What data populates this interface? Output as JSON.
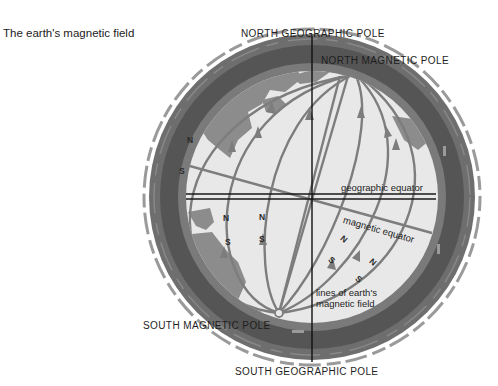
{
  "title": "The earth's magnetic field",
  "labels": {
    "north_geographic_pole": "NORTH GEOGRAPHIC POLE",
    "north_magnetic_pole": "NORTH MAGNETIC POLE",
    "south_magnetic_pole": "SOUTH MAGNETIC POLE",
    "south_geographic_pole": "SOUTH GEOGRAPHIC POLE",
    "geographic_equator": "geographic equator",
    "magnetic_equator": "magnetic equator",
    "field_lines_line1": "lines of earth's",
    "field_lines_line2": "magnetic field"
  },
  "compass_markers": [
    {
      "n": "N",
      "s": "S",
      "location": "left-atmosphere"
    },
    {
      "n": "N",
      "s": "S",
      "location": "left-inner"
    },
    {
      "n": "N",
      "s": "S",
      "location": "center-left"
    },
    {
      "n": "N",
      "s": "S",
      "location": "lower-right-1"
    },
    {
      "n": "N",
      "s": "S",
      "location": "lower-right-2"
    }
  ],
  "colors": {
    "background": "#ffffff",
    "outer_band": "#5a5a5a",
    "inner_disc": "#e6e6e6",
    "land": "#8a8a8a",
    "field_lines": "#7d7d7d",
    "axis": "#111111"
  }
}
